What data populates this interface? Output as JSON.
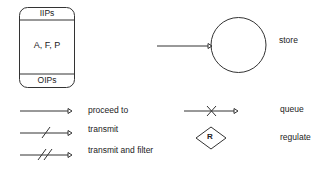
{
  "process_box": {
    "top_label": "IIPs",
    "center_label": "A, F, P",
    "bottom_label": "OIPs"
  },
  "legend": {
    "store": "store",
    "proceed_to": "proceed to",
    "transmit": "transmit",
    "transmit_and_filter": "transmit and filter",
    "queue": "queue",
    "regulate": "regulate",
    "regulate_symbol": "R"
  },
  "colors": {
    "stroke": "#333333",
    "background": "#ffffff"
  }
}
